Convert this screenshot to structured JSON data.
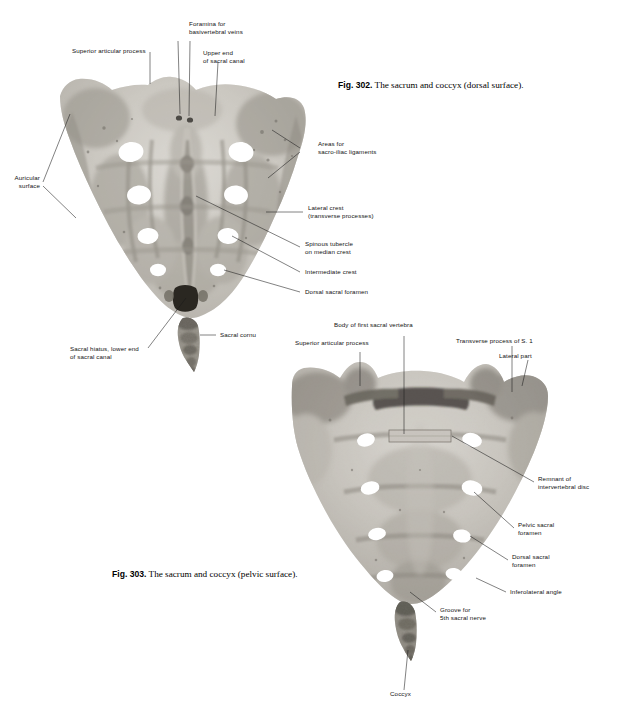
{
  "page": {
    "background": "#ffffff",
    "ink": "#111111"
  },
  "figures": [
    {
      "id": "fig-302",
      "caption_number": "Fig. 302.",
      "caption_text": "The sacrum and coccyx (dorsal surface).",
      "specimen": "sacrum-dorsal-surface",
      "labels": [
        {
          "name": "superior-articular-process",
          "lines": [
            "Superior articular process"
          ]
        },
        {
          "name": "foramina-for-basivertebral-veins",
          "lines": [
            "Foramina for",
            "basivertebral veins"
          ]
        },
        {
          "name": "upper-end-of-sacral-canal",
          "lines": [
            "Upper end",
            "of sacral canal"
          ]
        },
        {
          "name": "areas-for-sacro-iliac-ligaments",
          "lines": [
            "Areas for",
            "sacro-iliac ligaments"
          ]
        },
        {
          "name": "auricular-surface",
          "lines": [
            "Auricular",
            "surface"
          ]
        },
        {
          "name": "lateral-crest",
          "lines": [
            "Lateral crest",
            "(transverse processes)"
          ]
        },
        {
          "name": "spinous-tubercle-on-median-crest",
          "lines": [
            "Spinous tubercle",
            "on median crest"
          ]
        },
        {
          "name": "intermediate-crest",
          "lines": [
            "Intermediate crest"
          ]
        },
        {
          "name": "dorsal-sacral-foramen",
          "lines": [
            "Dorsal sacral foramen"
          ]
        },
        {
          "name": "sacral-cornu",
          "lines": [
            "Sacral cornu"
          ]
        },
        {
          "name": "sacral-hiatus",
          "lines": [
            "Sacral hiatus, lower end",
            "of sacral canal"
          ]
        }
      ]
    },
    {
      "id": "fig-303",
      "caption_number": "Fig. 303.",
      "caption_text": "The sacrum and coccyx (pelvic surface).",
      "specimen": "sacrum-pelvic-surface",
      "labels": [
        {
          "name": "body-of-first-sacral-vertebra",
          "lines": [
            "Body of first sacral vertebra"
          ]
        },
        {
          "name": "superior-articular-process",
          "lines": [
            "Superior articular process"
          ]
        },
        {
          "name": "transverse-process-of-s1",
          "lines": [
            "Transverse process of S. 1"
          ]
        },
        {
          "name": "lateral-part",
          "lines": [
            "Lateral part"
          ]
        },
        {
          "name": "remnant-of-intervertebral-disc",
          "lines": [
            "Remnant of",
            "intervertebral disc"
          ]
        },
        {
          "name": "pelvic-sacral-foramen",
          "lines": [
            "Pelvic sacral",
            "foramen"
          ]
        },
        {
          "name": "dorsal-sacral-foramen",
          "lines": [
            "Dorsal sacral",
            "foramen"
          ]
        },
        {
          "name": "inferolateral-angle",
          "lines": [
            "Inferolateral angle"
          ]
        },
        {
          "name": "groove-for-5th-sacral-nerve",
          "lines": [
            "Groove for",
            "5th sacral nerve"
          ]
        },
        {
          "name": "coccyx",
          "lines": [
            "Coccyx"
          ]
        }
      ]
    }
  ]
}
